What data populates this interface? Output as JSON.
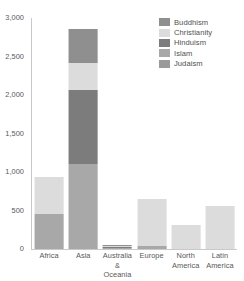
{
  "chart_data": {
    "type": "bar",
    "stacked": true,
    "title": "",
    "xlabel": "",
    "ylabel": "",
    "ylim": [
      0,
      3000
    ],
    "grid": false,
    "legend_position": "top-right",
    "ytick_labels": [
      "3,000",
      "2,500",
      "2,000",
      "1,500",
      "1,000",
      "500",
      "0"
    ],
    "ytick_values": [
      3000,
      2500,
      2000,
      1500,
      1000,
      500,
      0
    ],
    "categories": [
      "Africa",
      "Asia",
      "Australia & Oceania",
      "Europe",
      "North America",
      "Latin America"
    ],
    "category_label_lines": [
      [
        "Africa",
        ""
      ],
      [
        "Asia",
        ""
      ],
      [
        "Australia",
        "& Oceania"
      ],
      [
        "Europe",
        ""
      ],
      [
        "North",
        "America"
      ],
      [
        "Latin",
        "America"
      ]
    ],
    "series": [
      {
        "name": "Buddhism",
        "color": "#8f8f8f",
        "values": [
          0,
          450,
          5,
          0,
          0,
          0
        ]
      },
      {
        "name": "Christianity",
        "color": "#dcdcdc",
        "values": [
          480,
          350,
          10,
          605,
          310,
          560
        ]
      },
      {
        "name": "Hinduism",
        "color": "#7c7c7c",
        "values": [
          0,
          950,
          2,
          0,
          0,
          0
        ]
      },
      {
        "name": "Islam",
        "color": "#a8a8a8",
        "values": [
          450,
          1110,
          8,
          40,
          0,
          0
        ]
      },
      {
        "name": "Judaism",
        "color": "#9a9a9a",
        "values": [
          0,
          0,
          0,
          0,
          0,
          0
        ]
      }
    ],
    "stack_order_bottom_to_top": [
      "Islam",
      "Hinduism",
      "Christianity",
      "Buddhism"
    ],
    "totals": [
      930,
      2860,
      25,
      645,
      310,
      560
    ]
  },
  "legend": {
    "items": [
      {
        "label": "Buddhism",
        "color": "#8f8f8f"
      },
      {
        "label": "Christianity",
        "color": "#dcdcdc"
      },
      {
        "label": "Hinduism",
        "color": "#7c7c7c"
      },
      {
        "label": "Islam",
        "color": "#a8a8a8"
      },
      {
        "label": "Judaism",
        "color": "#9a9a9a"
      }
    ]
  },
  "colors": {
    "background": "#ffffff",
    "axis": "#c9c9c9",
    "text": "#585858"
  }
}
